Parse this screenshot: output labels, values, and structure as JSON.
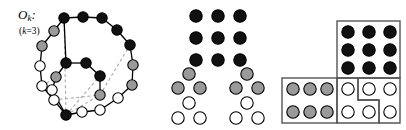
{
  "figure": {
    "background": "#ffffff"
  },
  "colors": {
    "black_node": "#111111",
    "gray_node": "#9a9a9a",
    "white_node": "#ffffff",
    "stroke": "#000000",
    "dashed_edge": "#aaaaaa",
    "box_stroke": "#555555"
  },
  "panels": {
    "graph": {
      "name": "odd-graph-panel",
      "label_main": "O",
      "label_sub": "k",
      "label_colon": ":",
      "label_k_prefix": "(",
      "label_k_var": "k",
      "label_k_rest": "=3)",
      "node_radius": 5.2,
      "nodes": [
        {
          "id": "n0",
          "x": 64,
          "y": 18,
          "fill": "black"
        },
        {
          "id": "n1",
          "x": 83,
          "y": 17,
          "fill": "black"
        },
        {
          "id": "n2",
          "x": 102,
          "y": 18,
          "fill": "black"
        },
        {
          "id": "n3",
          "x": 117,
          "y": 30,
          "fill": "black"
        },
        {
          "id": "n4",
          "x": 130,
          "y": 45,
          "fill": "black"
        },
        {
          "id": "n5",
          "x": 133,
          "y": 65,
          "fill": "gray"
        },
        {
          "id": "n6",
          "x": 132,
          "y": 85,
          "fill": "gray"
        },
        {
          "id": "n7",
          "x": 118,
          "y": 98,
          "fill": "white"
        },
        {
          "id": "n8",
          "x": 100,
          "y": 110,
          "fill": "white"
        },
        {
          "id": "n9",
          "x": 82,
          "y": 112,
          "fill": "white"
        },
        {
          "id": "n10",
          "x": 66,
          "y": 115,
          "fill": "black"
        },
        {
          "id": "n11",
          "x": 54,
          "y": 100,
          "fill": "white"
        },
        {
          "id": "n12",
          "x": 42,
          "y": 86,
          "fill": "white"
        },
        {
          "id": "n13",
          "x": 40,
          "y": 66,
          "fill": "white"
        },
        {
          "id": "n14",
          "x": 42,
          "y": 46,
          "fill": "gray"
        },
        {
          "id": "n15",
          "x": 54,
          "y": 31,
          "fill": "gray"
        },
        {
          "id": "n16",
          "x": 66,
          "y": 63,
          "fill": "black"
        },
        {
          "id": "n17",
          "x": 86,
          "y": 63,
          "fill": "black"
        },
        {
          "id": "n18",
          "x": 100,
          "y": 76,
          "fill": "black"
        },
        {
          "id": "n19",
          "x": 100,
          "y": 95,
          "fill": "gray"
        },
        {
          "id": "n20",
          "x": 56,
          "y": 77,
          "fill": "gray"
        },
        {
          "id": "n21",
          "x": 52,
          "y": 90,
          "fill": "white"
        }
      ],
      "solid_edges": [
        [
          "n0",
          "n1"
        ],
        [
          "n1",
          "n2"
        ],
        [
          "n2",
          "n3"
        ],
        [
          "n3",
          "n4"
        ],
        [
          "n4",
          "n5"
        ],
        [
          "n5",
          "n6"
        ],
        [
          "n6",
          "n7"
        ],
        [
          "n7",
          "n8"
        ],
        [
          "n8",
          "n9"
        ],
        [
          "n9",
          "n10"
        ],
        [
          "n10",
          "n11"
        ],
        [
          "n11",
          "n12"
        ],
        [
          "n12",
          "n13"
        ],
        [
          "n13",
          "n14"
        ],
        [
          "n14",
          "n15"
        ],
        [
          "n15",
          "n0"
        ],
        [
          "n16",
          "n17"
        ],
        [
          "n17",
          "n18"
        ],
        [
          "n18",
          "n19"
        ],
        [
          "n16",
          "n20"
        ],
        [
          "n20",
          "n21"
        ],
        [
          "n21",
          "n10"
        ],
        [
          "n16",
          "n0"
        ]
      ],
      "dashed_edges": [
        [
          "n0",
          "n10"
        ],
        [
          "n10",
          "n19"
        ],
        [
          "n19",
          "n4"
        ],
        [
          "n10",
          "n18"
        ],
        [
          "n12",
          "n20"
        ],
        [
          "n10",
          "n8"
        ],
        [
          "n11",
          "n19"
        ]
      ]
    },
    "stack": {
      "name": "ball-stack-panel",
      "node_radius": 6.2,
      "rows": [
        {
          "y": 16,
          "cells": [
            {
              "x": 44,
              "fill": "black"
            },
            {
              "x": 66,
              "fill": "black"
            },
            {
              "x": 88,
              "fill": "black"
            }
          ]
        },
        {
          "y": 38,
          "cells": [
            {
              "x": 44,
              "fill": "black"
            },
            {
              "x": 66,
              "fill": "black"
            },
            {
              "x": 88,
              "fill": "black"
            }
          ]
        },
        {
          "y": 60,
          "cells": [
            {
              "x": 44,
              "fill": "black"
            },
            {
              "x": 66,
              "fill": "black"
            },
            {
              "x": 88,
              "fill": "black"
            }
          ]
        },
        {
          "y": 74,
          "cells": [
            {
              "x": 37,
              "fill": "gray"
            },
            {
              "x": 95,
              "fill": "gray"
            }
          ]
        },
        {
          "y": 88,
          "cells": [
            {
              "x": 26,
              "fill": "gray"
            },
            {
              "x": 48,
              "fill": "gray"
            },
            {
              "x": 84,
              "fill": "gray"
            },
            {
              "x": 106,
              "fill": "gray"
            }
          ]
        },
        {
          "y": 103,
          "cells": [
            {
              "x": 37,
              "fill": "white"
            },
            {
              "x": 95,
              "fill": "white"
            }
          ]
        },
        {
          "y": 118,
          "cells": [
            {
              "x": 26,
              "fill": "white"
            },
            {
              "x": 48,
              "fill": "white"
            },
            {
              "x": 84,
              "fill": "white"
            },
            {
              "x": 106,
              "fill": "white"
            }
          ]
        }
      ]
    },
    "tiling": {
      "name": "tiling-panel",
      "node_radius": 6.2,
      "boxes": [
        {
          "name": "black-square-box",
          "x": 57,
          "y": 21,
          "w": 63,
          "h": 57
        },
        {
          "name": "gray-rect-box",
          "x": 2,
          "y": 78,
          "w": 55,
          "h": 45
        },
        {
          "name": "white-tromino-a",
          "path": "M57,78 L78,78 L78,100 L99,100 L99,123 L57,123 Z"
        },
        {
          "name": "white-tromino-b",
          "path": "M78,78 L120,78 L120,123 L99,123 L99,100 L78,100 Z"
        }
      ],
      "black_cells": [
        {
          "x": 68,
          "y": 32,
          "fill": "black"
        },
        {
          "x": 89,
          "y": 32,
          "fill": "black"
        },
        {
          "x": 110,
          "y": 32,
          "fill": "black"
        },
        {
          "x": 68,
          "y": 50,
          "fill": "black"
        },
        {
          "x": 89,
          "y": 50,
          "fill": "black"
        },
        {
          "x": 110,
          "y": 50,
          "fill": "black"
        },
        {
          "x": 68,
          "y": 68,
          "fill": "black"
        },
        {
          "x": 89,
          "y": 68,
          "fill": "black"
        },
        {
          "x": 110,
          "y": 68,
          "fill": "black"
        }
      ],
      "gray_cells": [
        {
          "x": 13,
          "y": 89,
          "fill": "gray"
        },
        {
          "x": 30,
          "y": 89,
          "fill": "gray"
        },
        {
          "x": 47,
          "y": 89,
          "fill": "gray"
        },
        {
          "x": 13,
          "y": 112,
          "fill": "gray"
        },
        {
          "x": 30,
          "y": 112,
          "fill": "gray"
        },
        {
          "x": 47,
          "y": 112,
          "fill": "gray"
        }
      ],
      "white_cells": [
        {
          "x": 68,
          "y": 89,
          "fill": "white"
        },
        {
          "x": 89,
          "y": 89,
          "fill": "white"
        },
        {
          "x": 110,
          "y": 89,
          "fill": "white"
        },
        {
          "x": 68,
          "y": 112,
          "fill": "white"
        },
        {
          "x": 89,
          "y": 112,
          "fill": "white"
        },
        {
          "x": 110,
          "y": 112,
          "fill": "white"
        }
      ]
    }
  }
}
